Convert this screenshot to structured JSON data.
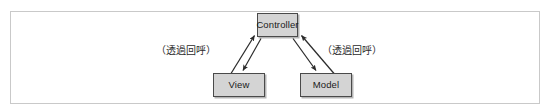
{
  "figure": {
    "type": "diagram",
    "frame": {
      "border_color": "#c9c9c9"
    },
    "nodes": [
      {
        "id": "controller",
        "label": "Controller"
      },
      {
        "id": "view",
        "label": "View"
      },
      {
        "id": "model",
        "label": "Model"
      }
    ],
    "edge_labels": [
      {
        "id": "left",
        "text": "（透過回呼）"
      },
      {
        "id": "right",
        "text": "（透過回呼）"
      }
    ],
    "edges": [
      {
        "from": "view",
        "to": "controller",
        "arrow": "to",
        "note": "（透過回呼）"
      },
      {
        "from": "controller",
        "to": "view",
        "arrow": "to"
      },
      {
        "from": "model",
        "to": "controller",
        "arrow": "to",
        "note": "（透過回呼）"
      },
      {
        "from": "controller",
        "to": "model",
        "arrow": "to"
      }
    ],
    "colors": {
      "node_fill": "#d4d4d4",
      "node_stroke": "#4a4a4a",
      "arrow_stroke": "#2b2b2b",
      "text": "#1a1a1a"
    }
  }
}
